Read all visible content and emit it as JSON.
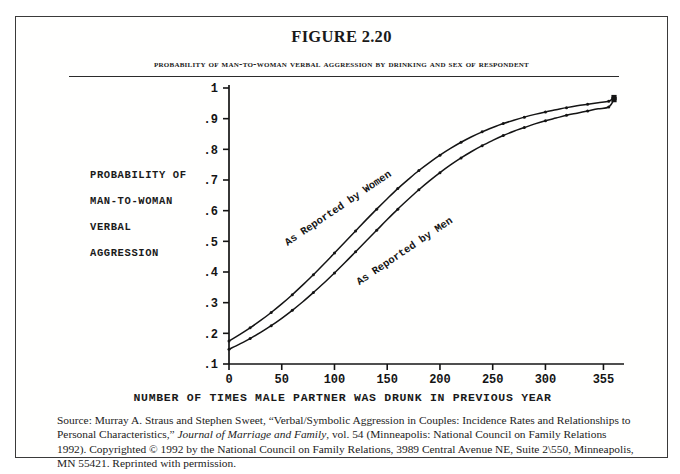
{
  "figure": {
    "number_label": "FIGURE 2.20",
    "subtitle": "Probability of Man-to-Woman Verbal Aggression by Drinking and Sex of Respondent"
  },
  "axis_titles": {
    "y_line1": "PROBABILITY OF",
    "y_line2": "MAN-TO-WOMAN",
    "y_line3": "VERBAL",
    "y_line4": "AGGRESSION",
    "x": "NUMBER OF TIMES MALE PARTNER WAS DRUNK IN PREVIOUS YEAR"
  },
  "source": {
    "line1": "Source: Murray A. Straus and Stephen Sweet, “Verbal/Symbolic Aggression in Couples: Incidence Rates and Relationships",
    "line2_pre": "to Personal Characteristics,” ",
    "line2_italic": "Journal of Marriage and Family",
    "line2_post": ", vol. 54 (Minneapolis: National Council on Family",
    "line3": "Relations 1992). Copyrighted © 1992 by the National Council on Family Relations, 3989 Central Avenue NE, Suite",
    "line4": "2\\550, Minneapolis, MN 55421. Reprinted with permission."
  },
  "colors": {
    "ink": "#1a1a1a",
    "frame": "#3a3a3a",
    "curve": "#141414",
    "background": "#ffffff"
  },
  "chart_data": {
    "type": "line",
    "title": "Probability of Man-to-Woman Verbal Aggression by Drinking and Sex of Respondent",
    "xlabel": "NUMBER OF TIMES MALE PARTNER WAS DRUNK IN PREVIOUS YEAR",
    "ylabel": "PROBABILITY OF MAN-TO-WOMAN VERBAL AGGRESSION",
    "xlim": [
      0,
      365
    ],
    "ylim": [
      0.1,
      1.0
    ],
    "grid": false,
    "legend_position": "inline-annotation",
    "x_ticks": [
      0,
      50,
      100,
      150,
      200,
      250,
      300,
      355
    ],
    "x_tick_labels": [
      "0",
      "50",
      "100",
      "150",
      "200",
      "250",
      "300",
      "355"
    ],
    "y_ticks": [
      0.1,
      0.2,
      0.3,
      0.4,
      0.5,
      0.6,
      0.7,
      0.8,
      0.9,
      1.0
    ],
    "y_tick_labels": [
      ".1",
      ".2",
      ".3",
      ".4",
      ".5",
      ".6",
      ".7",
      ".8",
      ".9",
      "1"
    ],
    "x": [
      0,
      10,
      20,
      30,
      40,
      50,
      60,
      70,
      80,
      90,
      100,
      110,
      120,
      130,
      140,
      150,
      160,
      170,
      180,
      190,
      200,
      210,
      220,
      230,
      240,
      250,
      260,
      270,
      280,
      290,
      300,
      310,
      320,
      330,
      340,
      350,
      360,
      365
    ],
    "series": [
      {
        "name": "As Reported by Women",
        "annotation": "As Reported by Women",
        "marker": "dot",
        "values": [
          0.175,
          0.196,
          0.218,
          0.242,
          0.268,
          0.296,
          0.326,
          0.358,
          0.391,
          0.426,
          0.462,
          0.498,
          0.534,
          0.57,
          0.605,
          0.639,
          0.672,
          0.702,
          0.731,
          0.757,
          0.781,
          0.803,
          0.823,
          0.841,
          0.857,
          0.871,
          0.884,
          0.895,
          0.905,
          0.914,
          0.922,
          0.929,
          0.936,
          0.942,
          0.947,
          0.952,
          0.957,
          0.969
        ]
      },
      {
        "name": "As Reported by Men",
        "annotation": "As Reported by Men",
        "marker": "dot",
        "values": [
          0.148,
          0.165,
          0.183,
          0.203,
          0.225,
          0.249,
          0.275,
          0.303,
          0.333,
          0.364,
          0.397,
          0.431,
          0.466,
          0.501,
          0.536,
          0.571,
          0.605,
          0.637,
          0.668,
          0.697,
          0.724,
          0.749,
          0.772,
          0.793,
          0.812,
          0.829,
          0.845,
          0.859,
          0.871,
          0.883,
          0.893,
          0.902,
          0.911,
          0.918,
          0.925,
          0.932,
          0.938,
          0.962
        ]
      }
    ],
    "annotations": [
      {
        "text": "As Reported by Women",
        "x": 105,
        "y": 0.6,
        "rotation": -34
      },
      {
        "text": "As Reported by Men",
        "x": 168,
        "y": 0.46,
        "rotation": -34
      }
    ]
  }
}
